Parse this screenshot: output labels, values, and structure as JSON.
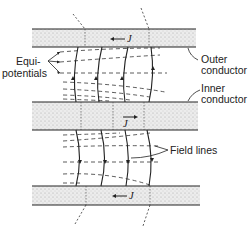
{
  "diagram": {
    "labels": {
      "equipotentials_line1": "Equi-",
      "equipotentials_line2": "potentials",
      "outer_conductor_line1": "Outer",
      "outer_conductor_line2": "conductor",
      "inner_conductor_line1": "Inner",
      "inner_conductor_line2": "conductor",
      "field_lines": "Field lines",
      "current_top": "J",
      "current_middle": "J",
      "current_bottom": "J"
    },
    "current_directions": {
      "top_outer": "left",
      "inner": "right",
      "bottom_outer": "left"
    },
    "colors": {
      "ink": "#222222",
      "band_fill": "#e6e6e6",
      "background": "#ffffff"
    }
  }
}
